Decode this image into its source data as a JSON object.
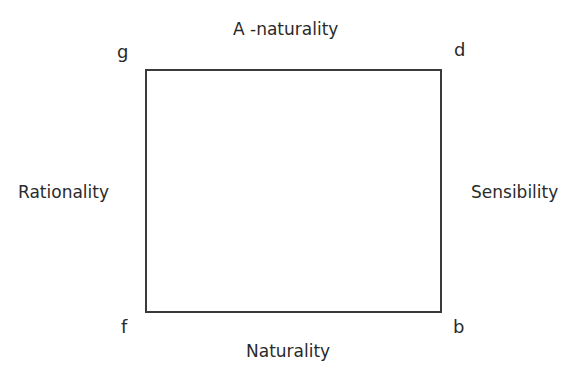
{
  "diagram": {
    "top_label": "A -naturality",
    "bottom_label": "Naturality",
    "left_label": "Rationality",
    "right_label": "Sensibility",
    "corners": {
      "top_left": "g",
      "top_right": "d",
      "bottom_left": "f",
      "bottom_right": "b"
    },
    "colors": {
      "line": "#3a3a3a",
      "text": "#2a2a2a"
    }
  }
}
